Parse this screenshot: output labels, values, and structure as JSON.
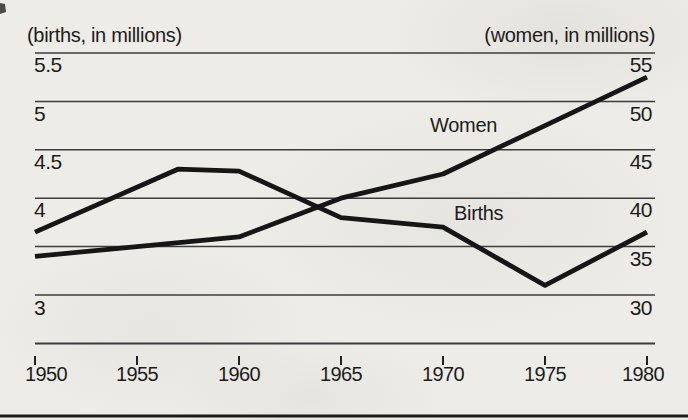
{
  "figure": {
    "left_axis_header": "(births, in millions)",
    "right_axis_header": "(women, in millions)",
    "colors": {
      "ink": "#1c1c1c",
      "data_line": "#161616",
      "gridline": "#3c3c3c",
      "paper": "#eeece7"
    }
  },
  "chart_data": {
    "type": "line",
    "title": "",
    "grid": "horizontal",
    "x_ticks": [
      "1950",
      "1955",
      "1960",
      "1965",
      "1970",
      "1975",
      "1980"
    ],
    "x_range": [
      1950,
      1980
    ],
    "left_axis": {
      "title": "(births, in millions)",
      "ticks": [
        "5.5",
        "5",
        "4.5",
        "4",
        "3"
      ],
      "tick_values": [
        5.5,
        5.0,
        4.5,
        4.0,
        3.0
      ],
      "range": [
        2.5,
        5.5
      ],
      "gridline_values": [
        5.5,
        5.0,
        4.5,
        4.0,
        3.5,
        3.0,
        2.5
      ]
    },
    "right_axis": {
      "title": "(women, in millions)",
      "ticks": [
        "55",
        "50",
        "45",
        "40",
        "35",
        "30"
      ],
      "tick_values": [
        55,
        50,
        45,
        40,
        35,
        30
      ],
      "range": [
        25,
        55
      ],
      "gridline_values": [
        55,
        50,
        45,
        40,
        35,
        30,
        25
      ]
    },
    "series": [
      {
        "name": "Births",
        "axis": "left",
        "units": "millions of births",
        "points": [
          [
            1950,
            3.65
          ],
          [
            1957,
            4.3
          ],
          [
            1960,
            4.28
          ],
          [
            1965,
            3.8
          ],
          [
            1970,
            3.7
          ],
          [
            1975,
            3.1
          ],
          [
            1980,
            3.65
          ]
        ]
      },
      {
        "name": "Women",
        "axis": "right",
        "units": "millions of women",
        "points": [
          [
            1950,
            34
          ],
          [
            1955,
            35
          ],
          [
            1960,
            36
          ],
          [
            1965,
            40
          ],
          [
            1970,
            42.5
          ],
          [
            1975,
            47.5
          ],
          [
            1980,
            52.5
          ]
        ]
      }
    ]
  }
}
